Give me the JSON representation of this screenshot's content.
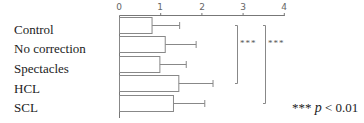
{
  "chart_data": {
    "type": "bar",
    "orientation": "horizontal",
    "categories": [
      "Control",
      "No correction",
      "Spectacles",
      "HCL",
      "SCL"
    ],
    "values": [
      0.79,
      1.11,
      0.98,
      1.44,
      1.31
    ],
    "error_upper": [
      1.46,
      1.86,
      1.62,
      2.27,
      2.07
    ],
    "xlim": [
      0,
      4
    ],
    "xticks": [
      "0",
      "1",
      "2",
      "3",
      "4"
    ],
    "title": "",
    "xlabel": "",
    "ylabel": "",
    "grid": false,
    "significance": [
      {
        "from": "Control",
        "to": "HCL",
        "label": "***"
      },
      {
        "from": "Control",
        "to": "SCL",
        "label": "***"
      }
    ],
    "annotation": "*** p < 0.01"
  },
  "labels": [
    "Control",
    "No correction",
    "Spectacles",
    "HCL",
    "SCL"
  ],
  "ticks": [
    "0",
    "1",
    "2",
    "3",
    "4"
  ],
  "sig1": "***",
  "sig2": "***",
  "note": {
    "stars": "***",
    "p": "p",
    "rest": " < 0.01"
  }
}
